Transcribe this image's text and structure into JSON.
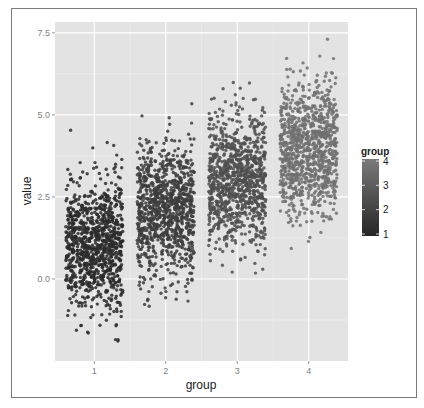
{
  "chart_data": {
    "type": "scatter",
    "title": "",
    "xlabel": "group",
    "ylabel": "value",
    "x_ticks": [
      "1",
      "2",
      "3",
      "4"
    ],
    "y_ticks": [
      "0.0",
      "2.5",
      "5.0",
      "7.5"
    ],
    "y_tick_values": [
      0.0,
      2.5,
      5.0,
      7.5
    ],
    "xlim": [
      0.45,
      4.55
    ],
    "ylim": [
      -2.5,
      7.83
    ],
    "grid": true,
    "jitter_width": 0.4,
    "series": [
      {
        "name": "1",
        "group": 1,
        "mean": 1.0,
        "sd": 1.0,
        "n": 1000,
        "min_observed": -1.9,
        "max_observed": 4.55,
        "color": "#2b2b2b"
      },
      {
        "name": "2",
        "group": 2,
        "mean": 2.0,
        "sd": 1.0,
        "n": 1000,
        "min_observed": -0.9,
        "max_observed": 5.6,
        "color": "#3d3d3d"
      },
      {
        "name": "3",
        "group": 3,
        "mean": 3.0,
        "sd": 1.0,
        "n": 1000,
        "min_observed": -0.05,
        "max_observed": 6.15,
        "color": "#4f4f4f"
      },
      {
        "name": "4",
        "group": 4,
        "mean": 4.0,
        "sd": 1.0,
        "n": 1000,
        "min_observed": 0.9,
        "max_observed": 7.35,
        "color": "#707070"
      }
    ],
    "legend": {
      "title": "group",
      "position": "right",
      "type": "colorbar",
      "labels": [
        "4",
        "3",
        "2",
        "1"
      ],
      "range": [
        1,
        4
      ],
      "color_low": "#262626",
      "color_high": "#7a7a7a"
    }
  },
  "axes": {
    "xlabel": "group",
    "ylabel": "value"
  },
  "legend": {
    "title": "group"
  }
}
